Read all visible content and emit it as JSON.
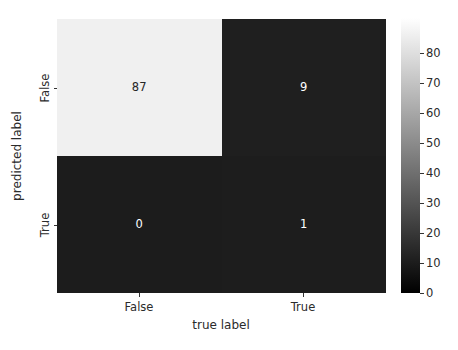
{
  "chart_data": {
    "type": "heatmap",
    "title": "",
    "xlabel": "true label",
    "ylabel": "predicted label",
    "xticklabels": [
      "False",
      "True"
    ],
    "yticklabels": [
      "False",
      "True"
    ],
    "grid": false,
    "colormap": "gray (greyscale, 0 = black, max = white)",
    "matrix": [
      [
        87,
        9
      ],
      [
        0,
        1
      ]
    ],
    "cells": [
      {
        "row": 0,
        "col": 0,
        "row_label": "False",
        "col_label": "False",
        "value": "87",
        "fill": "#f0f0f0",
        "text_color": "#262626"
      },
      {
        "row": 0,
        "col": 1,
        "row_label": "False",
        "col_label": "True",
        "value": "9",
        "fill": "#1f1f1f",
        "text_color": "#ffffff"
      },
      {
        "row": 1,
        "col": 0,
        "row_label": "True",
        "col_label": "False",
        "value": "0",
        "fill": "#1c1c1c",
        "text_color": "#ffffff"
      },
      {
        "row": 1,
        "col": 1,
        "row_label": "True",
        "col_label": "True",
        "value": "1",
        "fill": "#1d1d1d",
        "text_color": "#ffffff"
      }
    ],
    "colorbar": {
      "vmin": 0,
      "vmax": 87,
      "ticks": [
        0,
        10,
        20,
        30,
        40,
        50,
        60,
        70,
        80
      ],
      "ticklabels": [
        "0",
        "10",
        "20",
        "30",
        "40",
        "50",
        "60",
        "70",
        "80"
      ],
      "position": "right",
      "low_color": "#000000",
      "high_color": "#ffffff"
    }
  }
}
